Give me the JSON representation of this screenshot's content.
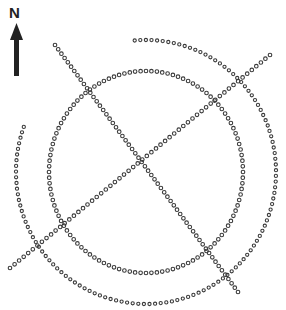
{
  "diagram": {
    "type": "dotted-circle-formation",
    "north_label": "N",
    "colors": {
      "dot_stroke": "#3a3a3a",
      "arrow": "#222222",
      "background": "#ffffff"
    },
    "elements": {
      "outer_circle": {
        "cx": 146,
        "cy": 172,
        "rx": 130,
        "ry": 132,
        "start_deg": -95,
        "end_deg": 200,
        "dot_count": 120
      },
      "inner_circle": {
        "cx": 146,
        "cy": 172,
        "rx": 97,
        "ry": 101,
        "dot_count": 112
      },
      "diagonal_line_1": {
        "x1": 10,
        "y1": 268,
        "x2": 270,
        "y2": 55,
        "dot_count": 58
      },
      "diagonal_line_2": {
        "x1": 55,
        "y1": 45,
        "x2": 238,
        "y2": 292,
        "dot_count": 58
      }
    }
  }
}
